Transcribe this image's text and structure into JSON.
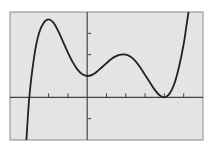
{
  "chart_data": {
    "type": "line",
    "title": "",
    "xlabel": "",
    "ylabel": "",
    "xlim": [
      -4,
      6
    ],
    "ylim": [
      -2,
      4
    ],
    "xscale_ticks": [
      -2,
      -1,
      1,
      2,
      3,
      4,
      5
    ],
    "yscale_ticks": [
      -1,
      1,
      2,
      3
    ],
    "tick_labels_shown": false,
    "grid": false,
    "legend": null,
    "series": [
      {
        "name": "f(x)",
        "color": "#222222",
        "points": [
          [
            -3.15,
            -2.0
          ],
          [
            -3.0,
            0.0
          ],
          [
            -2.75,
            1.9
          ],
          [
            -2.5,
            3.0
          ],
          [
            -2.25,
            3.5
          ],
          [
            -2.0,
            3.65
          ],
          [
            -1.75,
            3.5
          ],
          [
            -1.5,
            3.1
          ],
          [
            -1.25,
            2.6
          ],
          [
            -1.0,
            2.1
          ],
          [
            -0.75,
            1.65
          ],
          [
            -0.5,
            1.3
          ],
          [
            -0.25,
            1.08
          ],
          [
            0.0,
            1.0
          ],
          [
            0.25,
            1.05
          ],
          [
            0.5,
            1.2
          ],
          [
            0.75,
            1.4
          ],
          [
            1.0,
            1.6
          ],
          [
            1.25,
            1.8
          ],
          [
            1.5,
            1.93
          ],
          [
            1.75,
            2.0
          ],
          [
            2.0,
            2.0
          ],
          [
            2.25,
            1.9
          ],
          [
            2.5,
            1.7
          ],
          [
            2.75,
            1.4
          ],
          [
            3.0,
            1.05
          ],
          [
            3.25,
            0.7
          ],
          [
            3.5,
            0.35
          ],
          [
            3.75,
            0.1
          ],
          [
            4.0,
            0.0
          ],
          [
            4.25,
            0.15
          ],
          [
            4.5,
            0.6
          ],
          [
            4.75,
            1.4
          ],
          [
            5.0,
            2.5
          ],
          [
            5.15,
            3.4
          ],
          [
            5.25,
            4.0
          ]
        ]
      }
    ],
    "features": {
      "x_intercepts": [
        -3,
        4
      ],
      "y_intercept": 1,
      "local_max": [
        [
          -2,
          3.65
        ],
        [
          2,
          2.0
        ]
      ],
      "local_min": [
        [
          0,
          1.0
        ],
        [
          4,
          0.0
        ]
      ]
    }
  },
  "colors": {
    "plot_background": "#e4e4e4",
    "page_background": "#ffffff",
    "axis": "#444444",
    "frame": "#8a8a8a",
    "curve": "#222222"
  }
}
